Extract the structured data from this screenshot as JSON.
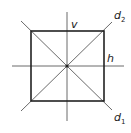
{
  "diagram": {
    "labels": {
      "vertical": "v",
      "horizontal": "h",
      "diagonal2_base": "d",
      "diagonal2_sub": "2",
      "diagonal1_base": "d",
      "diagonal1_sub": "1"
    },
    "colors": {
      "stroke": "#222222",
      "thin_stroke": "#444444",
      "background": "#ffffff"
    }
  }
}
